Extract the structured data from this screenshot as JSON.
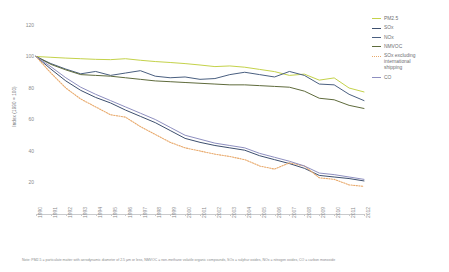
{
  "chart_data": {
    "type": "line",
    "title": "",
    "xlabel": "",
    "ylabel": "Index (1990 = 100)",
    "ylim": [
      0,
      120
    ],
    "yticks": [
      120,
      100,
      80,
      60,
      40,
      20
    ],
    "grid": false,
    "legend_position": "right",
    "x": [
      1990,
      1991,
      1992,
      1993,
      1994,
      1995,
      1996,
      1997,
      1998,
      1999,
      2000,
      2001,
      2002,
      2003,
      2004,
      2005,
      2006,
      2007,
      2008,
      2009,
      2010,
      2011,
      2012
    ],
    "categories": [
      "1990",
      "1991",
      "1992",
      "1993",
      "1994",
      "1995",
      "1996",
      "1997",
      "1998",
      "1999",
      "2000",
      "2001",
      "2002",
      "2003",
      "2004",
      "2005",
      "2006",
      "2007",
      "2008",
      "2009",
      "2010",
      "2011",
      "2012"
    ],
    "series": [
      {
        "name": "PM2.5",
        "color": "#c4d24a",
        "style": "solid",
        "values": [
          100,
          99.5,
          99.0,
          98.6,
          98.2,
          98.0,
          98.6,
          97.6,
          96.8,
          96.2,
          95.5,
          94.6,
          93.6,
          94.0,
          93.2,
          91.8,
          90.4,
          88.0,
          88.8,
          85.0,
          86.4,
          80.0,
          77.5
        ]
      },
      {
        "name": "SOx",
        "color": "#3d4f6e",
        "style": "solid",
        "values": [
          100,
          92.0,
          84.5,
          78.5,
          74.0,
          70.5,
          66.0,
          62.0,
          58.0,
          53.0,
          48.0,
          45.5,
          43.5,
          42.0,
          40.5,
          37.0,
          34.5,
          32.0,
          29.0,
          24.5,
          23.5,
          22.5,
          21.0
        ]
      },
      {
        "name": "NOx",
        "color": "#4a5f80",
        "style": "solid",
        "values": [
          100,
          95.5,
          92.0,
          89.0,
          90.5,
          88.0,
          89.5,
          91.0,
          87.5,
          86.5,
          87.0,
          85.5,
          86.0,
          88.5,
          90.0,
          88.5,
          87.0,
          90.5,
          88.0,
          82.5,
          82.0,
          76.0,
          72.0
        ]
      },
      {
        "name": "NMVOC",
        "color": "#5f6b3c",
        "style": "solid",
        "values": [
          100,
          95.0,
          91.5,
          88.5,
          88.0,
          87.5,
          86.5,
          85.5,
          84.5,
          84.0,
          83.5,
          83.0,
          82.5,
          82.0,
          82.0,
          81.5,
          81.0,
          80.5,
          78.0,
          73.5,
          72.5,
          69.0,
          67.0
        ]
      },
      {
        "name": "SOx excluding\ninternational\nshipping",
        "color": "#e8a96b",
        "style": "dotted",
        "values": [
          100,
          89.5,
          80.0,
          73.0,
          68.0,
          63.0,
          61.5,
          55.5,
          50.5,
          45.5,
          42.0,
          40.0,
          38.0,
          36.5,
          34.5,
          30.5,
          28.5,
          32.5,
          30.5,
          23.0,
          22.0,
          18.5,
          17.5
        ]
      },
      {
        "name": "CO",
        "color": "#8e8fc0",
        "style": "solid",
        "values": [
          100,
          93.5,
          86.5,
          80.5,
          76.0,
          72.0,
          68.0,
          64.0,
          60.0,
          55.0,
          50.0,
          47.5,
          45.0,
          43.5,
          42.0,
          38.5,
          36.0,
          33.5,
          30.5,
          26.0,
          25.0,
          23.5,
          22.0
        ]
      }
    ]
  },
  "yaxis": {
    "title": "Index (1990 = 100)",
    "ticks": [
      "120",
      "100",
      "80",
      "60",
      "40",
      "20"
    ]
  },
  "legend": {
    "items": [
      {
        "label": "PM2.5",
        "color": "#c4d24a",
        "style": "solid"
      },
      {
        "label": "SOx",
        "color": "#3d4f6e",
        "style": "solid"
      },
      {
        "label": "NOx",
        "color": "#4a5f80",
        "style": "solid"
      },
      {
        "label": "NMVOC",
        "color": "#5f6b3c",
        "style": "solid"
      },
      {
        "label": "SOx excluding\ninternational\nshipping",
        "color": "#e8a96b",
        "style": "dotted"
      },
      {
        "label": "CO",
        "color": "#8e8fc0",
        "style": "solid"
      }
    ]
  },
  "footnote": {
    "text": "Note: PM2.5 = particulate matter with aerodynamic diameter of 2.5 µm or less, NMVOC = non-methane volatile organic compounds, SOx = sulphur oxides, NOx = nitrogen oxides, CO = carbon monoxide"
  }
}
